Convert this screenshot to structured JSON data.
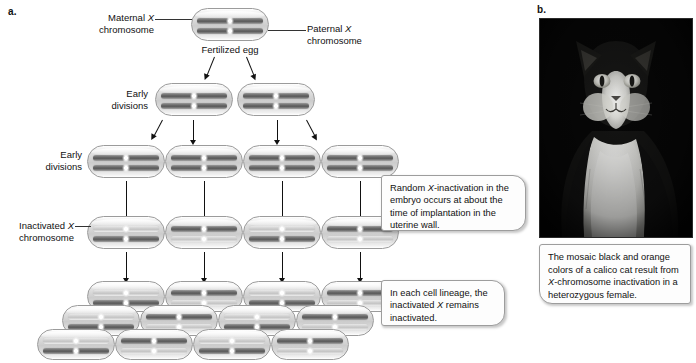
{
  "figure": {
    "panel_a_letter": "a.",
    "panel_b_letter": "b."
  },
  "labels": {
    "maternal": "Maternal X\nchromosome",
    "paternal": "Paternal X\nchromosome",
    "fertilized_egg": "Fertilized egg",
    "early_divisions_1": "Early\ndivisions",
    "early_divisions_2": "Early\ndivisions",
    "inactivated": "Inactivated X\nchromosome"
  },
  "callouts": {
    "random_inactivation": "Random X-inactivation in the embryo occurs at about the time of implantation in the uterine wall.",
    "lineage": "In each cell lineage, the inactivated X remains inactivated."
  },
  "photo": {
    "alt_name": "calico-cat-photo",
    "caption": "The mosaic black and orange colors of a calico cat result from X-chromosome inactivation in a heterozygous female."
  },
  "colors": {
    "background": "#ffffff",
    "active_chromosome": "#595959",
    "inactivated_chromosome": "#c4c4c4",
    "cell_outline": "#9b9b9b",
    "arrow": "#111111",
    "callout_border": "#9d9d9d",
    "photo_background": "#050505"
  },
  "diagram": {
    "rows": [
      {
        "name": "fertilized-egg-row",
        "cells": [
          {
            "top": "dark",
            "bottom": "dark"
          }
        ]
      },
      {
        "name": "early-divisions-row-1",
        "cells": [
          {
            "top": "dark",
            "bottom": "dark"
          },
          {
            "top": "dark",
            "bottom": "dark"
          }
        ]
      },
      {
        "name": "early-divisions-row-2",
        "cells": [
          {
            "top": "dark",
            "bottom": "dark"
          },
          {
            "top": "dark",
            "bottom": "dark"
          },
          {
            "top": "dark",
            "bottom": "dark"
          },
          {
            "top": "dark",
            "bottom": "dark"
          }
        ]
      },
      {
        "name": "inactivated-row",
        "cells": [
          {
            "top": "light",
            "bottom": "dark"
          },
          {
            "top": "dark",
            "bottom": "light"
          },
          {
            "top": "light",
            "bottom": "dark"
          },
          {
            "top": "dark",
            "bottom": "light"
          }
        ]
      },
      {
        "name": "lineage-row-1",
        "cells": [
          {
            "top": "light",
            "bottom": "dark"
          },
          {
            "top": "dark",
            "bottom": "light"
          },
          {
            "top": "light",
            "bottom": "dark"
          },
          {
            "top": "dark",
            "bottom": "light"
          }
        ]
      },
      {
        "name": "lineage-row-2",
        "cells": [
          {
            "top": "light",
            "bottom": "dark"
          },
          {
            "top": "dark",
            "bottom": "light"
          },
          {
            "top": "light",
            "bottom": "dark"
          },
          {
            "top": "dark",
            "bottom": "light"
          }
        ]
      },
      {
        "name": "lineage-row-3",
        "cells": [
          {
            "top": "light",
            "bottom": "dark"
          },
          {
            "top": "dark",
            "bottom": "light"
          },
          {
            "top": "light",
            "bottom": "dark"
          },
          {
            "top": "dark",
            "bottom": "light"
          }
        ]
      }
    ]
  }
}
